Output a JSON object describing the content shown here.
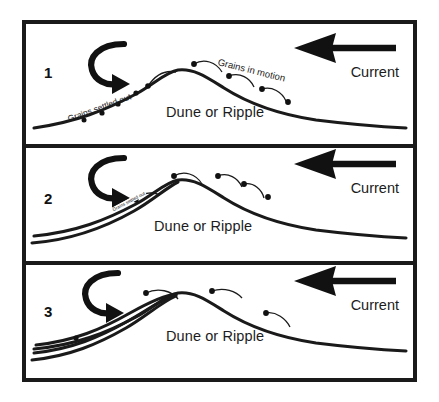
{
  "figure": {
    "type": "cross-bedding-formation-diagram",
    "background": "#ffffff",
    "ink_color": "#1a1a1a"
  },
  "panels": [
    {
      "number": "1",
      "bedform_label": "Dune or Ripple",
      "current_label": "Current",
      "annotations": [
        {
          "name": "grains-settled-out",
          "text": "Grains settled out"
        },
        {
          "name": "grains-in-motion",
          "text": "Grains in motion"
        }
      ],
      "foreset_layers": 0,
      "caption_meaning": "Grains move up the stoss side and settle out on the lee face"
    },
    {
      "number": "2",
      "bedform_label": "Dune or Ripple",
      "current_label": "Current",
      "annotations": [
        {
          "name": "grains-settled-out",
          "text": "Grains settled out"
        }
      ],
      "foreset_layers": 1,
      "caption_meaning": "A first cross-bed layer accretes on the lee slope"
    },
    {
      "number": "3",
      "bedform_label": "Dune or Ripple",
      "current_label": "Current",
      "annotations": [],
      "foreset_layers": 3,
      "caption_meaning": "Successive foreset layers build up the cross-bedding"
    }
  ],
  "icons": {
    "current_arrow": "left-arrow-icon",
    "eddy_arrow": "curved-eddy-arrow-icon",
    "grain": "grain-dot-icon"
  }
}
